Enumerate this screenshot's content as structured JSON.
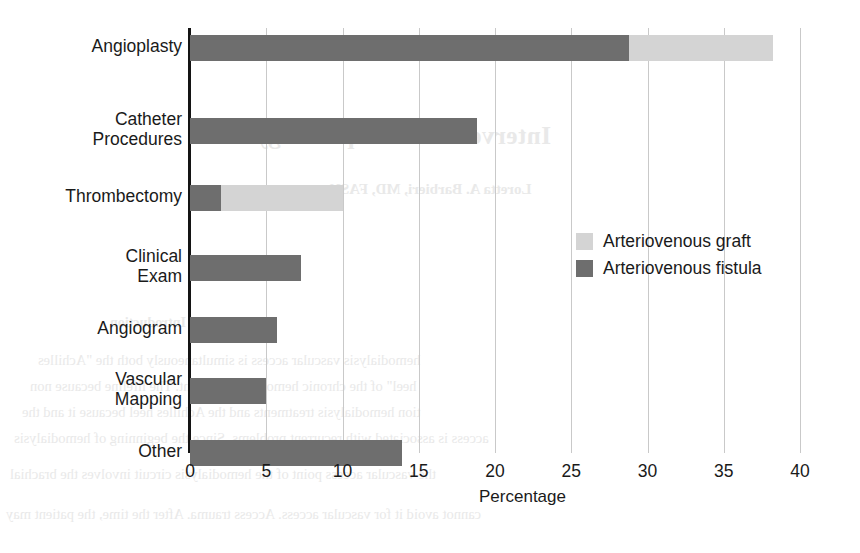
{
  "chart_data": {
    "type": "bar",
    "orientation": "horizontal",
    "stacked": true,
    "title": "",
    "xlabel": "Percentage",
    "ylabel": "",
    "xlim": [
      0,
      40
    ],
    "xticks": [
      0,
      5,
      10,
      15,
      20,
      25,
      30,
      35,
      40
    ],
    "xtick_labels": [
      "0",
      "5",
      "10",
      "15",
      "20",
      "25",
      "30",
      "35",
      "40"
    ],
    "grid": "vertical",
    "legend_position": "center-right",
    "categories": [
      "Angioplasty",
      "Catheter\nProcedures",
      "Thrombectomy",
      "Clinical\nExam",
      "Angiogram",
      "Vascular\nMapping",
      "Other"
    ],
    "series": [
      {
        "name": "Arteriovenous fistula",
        "color": "#6e6e6e",
        "values": [
          28.8,
          18.8,
          2.0,
          7.3,
          5.7,
          5.0,
          13.9
        ]
      },
      {
        "name": "Arteriovenous graft",
        "color": "#d4d4d4",
        "values": [
          9.4,
          0,
          8.0,
          0,
          0,
          0,
          0
        ]
      }
    ]
  },
  "legend": {
    "items": [
      {
        "label": "Arteriovenous graft",
        "color": "#d4d4d4"
      },
      {
        "label": "Arteriovenous fistula",
        "color": "#6e6e6e"
      }
    ]
  },
  "bleed_through": {
    "title": "Interventional Nephrology",
    "subtitle": "Loretta A. Barbieri, MD, FASN",
    "heading": "Introduction",
    "lines": [
      "hemodialysis vascular access is simultaneously both the \"Achilles",
      "heel\" of the chronic hemodialysis patient. The lifeline because non",
      "tion hemodialysis treatments and the Achilles heel because it and the",
      "access is associated with recurrent problems. Since the beginning of hemodialysis",
      "the vascular access point of the hemodialysis circuit involves the brachial",
      "cannot avoid it for vascular access. Access trauma. After the time, the patient may"
    ]
  }
}
